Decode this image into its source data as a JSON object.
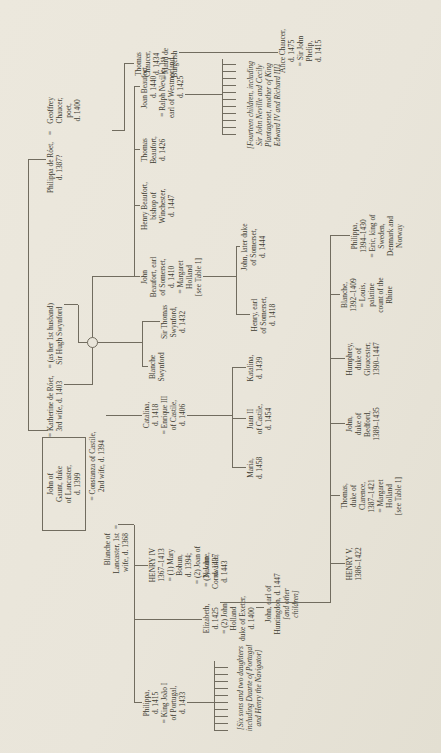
{
  "colors": {
    "paper": "#e9e5da",
    "ink": "#403c32",
    "rule": "#716c5f"
  },
  "eq_sign": "=",
  "tree": {
    "gaunt": {
      "lines": [
        "John of",
        "Gaunt, duke",
        "of Lancaster,",
        "d. 1399"
      ]
    },
    "blanche_lancaster": {
      "lines": [
        "Blanche of",
        "Lancaster, 1st",
        "wife, d. 1368"
      ]
    },
    "katherine": {
      "lines": [
        "= Katherine de Róet,",
        "3rd wife, d. 1403"
      ]
    },
    "hugh_swynford": {
      "lines": [
        "= (as her 1st husband)",
        "Sir Hugh Swynford"
      ]
    },
    "constanza": {
      "lines": [
        "= Constanza of Castile,",
        "2nd wife, d. 1394"
      ]
    },
    "philippa_roet": {
      "lines": [
        "Philippa de Róet,",
        "d. 1387?"
      ]
    },
    "geoffrey_chaucer": {
      "lines": [
        "Geoffrey",
        "Chaucer,",
        "poet,",
        "d. 1400"
      ]
    },
    "thomas_chaucer": {
      "lines": [
        "Thomas",
        "Chaucer,",
        "d. 1434",
        "= Maud de",
        "Burgersh"
      ]
    },
    "alice_chaucer": {
      "lines": [
        "Alice Chaucer,",
        "d. 1475",
        "= Sir John",
        "Phelip,",
        "d. 1415"
      ]
    },
    "john_beaufort": {
      "lines": [
        "John",
        "Beaufort, earl",
        "of Somerset,",
        "d. 1410",
        "= Margaret",
        "Holland",
        "[see Table 1]"
      ]
    },
    "henry_beaufort": {
      "lines": [
        "Henry Beaufort,",
        "bishop of",
        "Winchester,",
        "d. 1447"
      ]
    },
    "thomas_beaufort": {
      "lines": [
        "Thomas",
        "Beaufort,",
        "d. 1426"
      ]
    },
    "joan_beaufort": {
      "lines": [
        "Joan Beaufort,",
        "d. 1440",
        "= Ralph Neville, 1st",
        "earl of Westmorland,",
        "d. 1425"
      ]
    },
    "blanche_swynford": {
      "lines": [
        "Blanche",
        "Swynford"
      ]
    },
    "thomas_swynford": {
      "lines": [
        "Sir Thomas",
        "Swynford,",
        "d. 1432"
      ]
    },
    "catalina": {
      "lines": [
        "Catalina,",
        "d. 1418",
        "= Enrique III",
        "of Castile,",
        "d. 1406"
      ]
    },
    "henry_iv": {
      "lines": [
        "HENRY IV",
        "1367–1413",
        "= (1) Mary",
        "Bohun,",
        "d. 1394;",
        "= (2) Joan of",
        "Navarre,",
        "d. 1437"
      ]
    },
    "elizabeth": {
      "lines": [
        "Elizabeth,",
        "d. 1425",
        "= (2) John",
        "Holland",
        "duke of Exeter,",
        "d. 1400"
      ]
    },
    "cornwaille": {
      "lines": [
        "= (3) John",
        "Cornwaille,",
        "d. 1443"
      ]
    },
    "philippa_1415": {
      "lines": [
        "Philippa,",
        "d. 1415",
        "= King João I",
        "of Portugal,",
        "d. 1433"
      ]
    },
    "fourteen_children": {
      "lines": [
        "[Fourteen children, including",
        "Sir John Neville and Cecily",
        "Plantagenet, mother of King",
        "Edward IV and Richard III]"
      ]
    },
    "henry_somerset": {
      "lines": [
        "Henry, earl",
        "of Somerset,",
        "d. 1418"
      ]
    },
    "john_somerset": {
      "lines": [
        "John, later duke",
        "of Somerset,",
        "d. 1444"
      ]
    },
    "maria": {
      "lines": [
        "Maria,",
        "d. 1458"
      ]
    },
    "juan_ii": {
      "lines": [
        "Juan II",
        "of Castile,",
        "d. 1454"
      ]
    },
    "katalina": {
      "lines": [
        "Katalina,",
        "d. 1439"
      ]
    },
    "six_sons": {
      "lines": [
        "[Six sons and two daughters",
        "including Duarte of Portugal",
        "and Henry the Navigator]"
      ]
    },
    "huntingdon": {
      "lines": [
        "John, earl of",
        "Huntingdon, d. 1447"
      ]
    },
    "huntingdon_note": {
      "lines": [
        "[and other",
        "children]"
      ]
    },
    "henry_v": {
      "lines": [
        "HENRY V,",
        "1386–1422"
      ]
    },
    "clarence": {
      "lines": [
        "Thomas,",
        "duke of",
        "Clarence,",
        "1387–1421",
        "= Margaret",
        "Holland",
        "[see Table 1]"
      ]
    },
    "bedford": {
      "lines": [
        "John,",
        "duke of",
        "Bedford,",
        "1389–1435"
      ]
    },
    "humphrey": {
      "lines": [
        "Humphrey,",
        "duke of",
        "Gloucester,",
        "1390–1447"
      ]
    },
    "blanche_1392": {
      "lines": [
        "Blanche,",
        "1392–1409",
        "= Louis,",
        "palatine",
        "count of the",
        "Rhine"
      ]
    },
    "philippa_1394": {
      "lines": [
        "Philippa,",
        "1394–1430",
        "= Eric, king of",
        "Sweden,",
        "Denmark and",
        "Norway"
      ]
    }
  }
}
